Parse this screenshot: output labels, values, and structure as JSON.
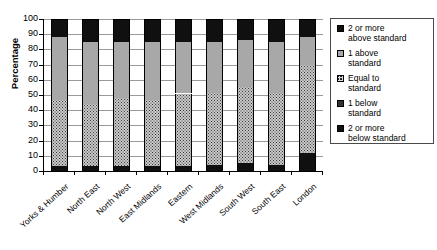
{
  "chart_data": {
    "type": "bar",
    "subtype": "stacked-bar-100",
    "title": "",
    "xlabel": "",
    "ylabel": "Percentage",
    "ylim": [
      0,
      100
    ],
    "ytick_step": 10,
    "yticks": [
      100,
      90,
      80,
      70,
      60,
      50,
      40,
      30,
      20,
      10,
      0
    ],
    "grid": true,
    "grid_axis": "y",
    "legend_position": "right",
    "categories": [
      "Yorks & Humber",
      "North East",
      "North West",
      "East Midlands",
      "Eastern",
      "West Midlands",
      "South West",
      "South East",
      "London"
    ],
    "series": [
      {
        "name": "2 or more below standard",
        "fill": "black",
        "color": "#101010",
        "values": [
          3,
          3,
          3,
          3,
          3,
          4,
          5,
          4,
          12
        ]
      },
      {
        "name": "1 below standard",
        "fill": "dots",
        "color": "#c9c9c9",
        "values": [
          44,
          41,
          45,
          44,
          48,
          47,
          50,
          47,
          58
        ]
      },
      {
        "name": "Equal to standard",
        "fill": "white",
        "color": "#ffffff",
        "values": [
          0,
          0,
          0,
          0,
          0,
          0,
          0,
          0,
          0
        ]
      },
      {
        "name": "1 above standard",
        "fill": "gray",
        "color": "#a8a8a8",
        "values": [
          41,
          41,
          37,
          38,
          34,
          34,
          31,
          34,
          18
        ]
      },
      {
        "name": "2 or more above standard",
        "fill": "black",
        "color": "#101010",
        "values": [
          12,
          15,
          15,
          15,
          15,
          15,
          14,
          15,
          12
        ]
      }
    ]
  },
  "legend": {
    "items": [
      {
        "label_line1": "2 or more",
        "label_line2": "above standard",
        "swatch": "black"
      },
      {
        "label_line1": "1 above",
        "label_line2": "standard",
        "swatch": "gray"
      },
      {
        "label_line1": "Equal to",
        "label_line2": "standard",
        "swatch": "xhatch"
      },
      {
        "label_line1": "1 below",
        "label_line2": "standard",
        "swatch": "dots"
      },
      {
        "label_line1": "2 or more",
        "label_line2": "below standard",
        "swatch": "black"
      }
    ]
  }
}
